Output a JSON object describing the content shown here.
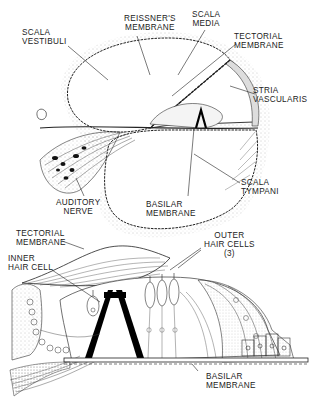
{
  "upper_diagram": {
    "title": "Cochlea cross-section",
    "labels": {
      "scala_vestibuli": "SCALA\nVESTIBULI",
      "reissners_membrane": "REISSNER'S\nMEMBRANE",
      "scala_media": "SCALA\nMEDIA",
      "tectorial_membrane": "TECTORIAL\nMEMBRANE",
      "stria_vascularis": "STRIA\nVASCULARIS",
      "scala_tympani": "SCALA\nTYMPANI",
      "basilar_membrane": "BASILAR\nMEMBRANE",
      "auditory_nerve": "AUDITORY\nNERVE"
    }
  },
  "lower_diagram": {
    "title": "Organ of Corti",
    "labels": {
      "tectorial_membrane": "TECTORIAL\nMEMBRANE",
      "inner_hair_cell": "INNER\nHAIR CELL",
      "outer_hair_cells": "OUTER\nHAIR CELLS\n(3)",
      "basilar_membrane": "BASILAR\nMEMBRANE"
    }
  },
  "colors": {
    "ink": "#1a1a1a",
    "stipple": "#9a9a9a",
    "background": "#ffffff"
  }
}
